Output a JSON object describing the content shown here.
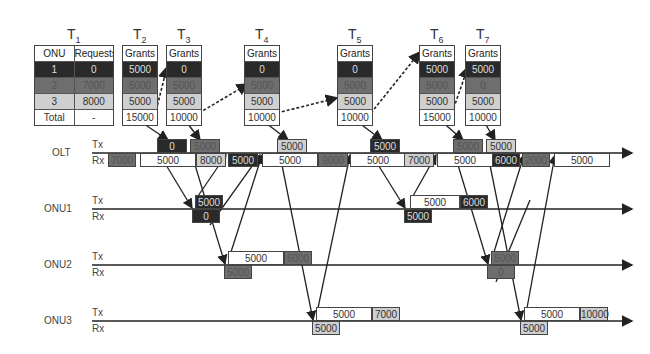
{
  "tables": [
    {
      "title": "T",
      "sub": "1",
      "header": [
        "ONU",
        "Requests"
      ],
      "rows": [
        [
          "1",
          "0"
        ],
        [
          "2",
          "7000"
        ],
        [
          "3",
          "8000"
        ],
        [
          "Total",
          "-"
        ]
      ]
    },
    {
      "title": "T",
      "sub": "2",
      "header": [
        "Grants"
      ],
      "rows": [
        [
          "5000"
        ],
        [
          "5000"
        ],
        [
          "5000"
        ],
        [
          "15000"
        ]
      ]
    },
    {
      "title": "T",
      "sub": "3",
      "header": [
        "Grants"
      ],
      "rows": [
        [
          "0"
        ],
        [
          "5000"
        ],
        [
          "5000"
        ],
        [
          "10000"
        ]
      ]
    },
    {
      "title": "T",
      "sub": "4",
      "header": [
        "Grants"
      ],
      "rows": [
        [
          "0"
        ],
        [
          "5000"
        ],
        [
          "5000"
        ],
        [
          "10000"
        ]
      ]
    },
    {
      "title": "T",
      "sub": "5",
      "header": [
        "Grants"
      ],
      "rows": [
        [
          "0"
        ],
        [
          "5000"
        ],
        [
          "5000"
        ],
        [
          "10000"
        ]
      ]
    },
    {
      "title": "T",
      "sub": "6",
      "header": [
        "Grants"
      ],
      "rows": [
        [
          "5000"
        ],
        [
          "5000"
        ],
        [
          "5000"
        ],
        [
          "15000"
        ]
      ]
    },
    {
      "title": "T",
      "sub": "7",
      "header": [
        "Grants"
      ],
      "rows": [
        [
          "5000"
        ],
        [
          "0"
        ],
        [
          "5000"
        ],
        [
          "10000"
        ]
      ]
    }
  ],
  "nodes": {
    "olt": {
      "name": "OLT",
      "tx": "Tx",
      "rx": "Rx"
    },
    "onu1": {
      "name": "ONU1",
      "tx": "Tx",
      "rx": "Rx"
    },
    "onu2": {
      "name": "ONU2",
      "tx": "Tx",
      "rx": "Rx"
    },
    "onu3": {
      "name": "ONU3",
      "tx": "Tx",
      "rx": "Rx"
    }
  },
  "olt_tx": [
    {
      "x": 157,
      "w": 30,
      "v": "0",
      "s": "s1"
    },
    {
      "x": 190,
      "w": 30,
      "v": "5000",
      "s": "s2"
    },
    {
      "x": 277,
      "w": 30,
      "v": "5000",
      "s": "s3"
    },
    {
      "x": 370,
      "w": 30,
      "v": "5000",
      "s": "s1"
    },
    {
      "x": 453,
      "w": 30,
      "v": "5000",
      "s": "s2"
    },
    {
      "x": 486,
      "w": 30,
      "v": "5000",
      "s": "s3"
    }
  ],
  "olt_rx": [
    {
      "x": 108,
      "w": 28,
      "v": "7000",
      "s": "s2"
    },
    {
      "x": 140,
      "w": 56,
      "v": "5000",
      "s": "s0"
    },
    {
      "x": 196,
      "w": 30,
      "v": "8000",
      "s": "s3"
    },
    {
      "x": 228,
      "w": 30,
      "v": "5000",
      "s": "s1"
    },
    {
      "x": 262,
      "w": 56,
      "v": "5000",
      "s": "s0"
    },
    {
      "x": 318,
      "w": 30,
      "v": "9000",
      "s": "s2"
    },
    {
      "x": 350,
      "w": 56,
      "v": "5000",
      "s": "s0"
    },
    {
      "x": 404,
      "w": 30,
      "v": "7000",
      "s": "s3"
    },
    {
      "x": 437,
      "w": 56,
      "v": "5000",
      "s": "s0"
    },
    {
      "x": 492,
      "w": 28,
      "v": "6000",
      "s": "s1"
    },
    {
      "x": 522,
      "w": 28,
      "v": "2000",
      "s": "s2"
    },
    {
      "x": 554,
      "w": 56,
      "v": "5000",
      "s": "s0"
    }
  ],
  "onu1_tx": [
    {
      "x": 195,
      "w": 28,
      "v": "5000",
      "s": "s1"
    },
    {
      "x": 410,
      "w": 50,
      "v": "5000",
      "s": "s0"
    },
    {
      "x": 460,
      "w": 28,
      "v": "6000",
      "s": "s1"
    }
  ],
  "onu1_rx": [
    {
      "x": 192,
      "w": 28,
      "v": "0",
      "s": "s1"
    },
    {
      "x": 404,
      "w": 28,
      "v": "5000",
      "s": "s1"
    }
  ],
  "onu2_tx": [
    {
      "x": 228,
      "w": 56,
      "v": "5000",
      "s": "s0"
    },
    {
      "x": 284,
      "w": 28,
      "v": "6000",
      "s": "s2"
    },
    {
      "x": 491,
      "w": 28,
      "v": "5000",
      "s": "s2"
    }
  ],
  "onu2_rx": [
    {
      "x": 224,
      "w": 28,
      "v": "5000",
      "s": "s2"
    },
    {
      "x": 487,
      "w": 28,
      "v": "0",
      "s": "s2"
    }
  ],
  "onu3_tx": [
    {
      "x": 316,
      "w": 56,
      "v": "5000",
      "s": "s0"
    },
    {
      "x": 372,
      "w": 28,
      "v": "7000",
      "s": "s3"
    },
    {
      "x": 524,
      "w": 56,
      "v": "5000",
      "s": "s0"
    },
    {
      "x": 580,
      "w": 28,
      "v": "10000",
      "s": "s3"
    }
  ],
  "onu3_rx": [
    {
      "x": 312,
      "w": 28,
      "v": "5000",
      "s": "s3"
    },
    {
      "x": 520,
      "w": 28,
      "v": "5000",
      "s": "s3"
    }
  ]
}
